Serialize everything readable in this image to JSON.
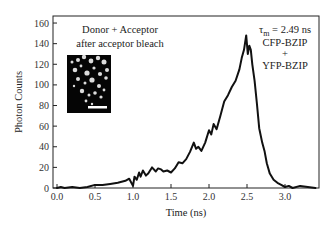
{
  "chart_data": {
    "type": "line",
    "title": "",
    "xlabel": "Time (ns)",
    "ylabel": "Photon Counts",
    "xlim": [
      0.0,
      3.45
    ],
    "ylim": [
      0,
      165
    ],
    "xticks": [
      "0.0",
      "0.5",
      "1.0",
      "1.5",
      "2.0",
      "2.5",
      "3.0"
    ],
    "yticks": [
      "0",
      "20",
      "40",
      "60",
      "80",
      "100",
      "120",
      "140",
      "160"
    ],
    "grid": false,
    "legend": null,
    "annotations": {
      "condition_line1": "Donor + Acceptor",
      "condition_line2": "after acceptor bleach",
      "tau_symbol": "τ",
      "tau_subscript": "m",
      "tau_value": " = 2.49 ns",
      "construct1": "CFP-BZIP",
      "plus": "+",
      "construct2": "YFP-BZIP"
    },
    "inset": "fluorescence micrograph (white puncta on black) with scale bar",
    "series": [
      {
        "name": "Photon Counts",
        "x": [
          0.0,
          0.05,
          0.1,
          0.2,
          0.3,
          0.4,
          0.5,
          0.55,
          0.6,
          0.7,
          0.8,
          0.9,
          0.95,
          1.0,
          1.02,
          1.05,
          1.08,
          1.1,
          1.13,
          1.17,
          1.2,
          1.25,
          1.3,
          1.33,
          1.37,
          1.4,
          1.45,
          1.5,
          1.55,
          1.6,
          1.65,
          1.7,
          1.75,
          1.8,
          1.83,
          1.86,
          1.9,
          1.95,
          2.0,
          2.03,
          2.06,
          2.1,
          2.15,
          2.2,
          2.25,
          2.3,
          2.35,
          2.4,
          2.43,
          2.46,
          2.49,
          2.51,
          2.53,
          2.55,
          2.57,
          2.6,
          2.63,
          2.66,
          2.7,
          2.73,
          2.76,
          2.8,
          2.85,
          2.9,
          2.95,
          3.0,
          3.05,
          3.1,
          3.2,
          3.3,
          3.4
        ],
        "y": [
          0,
          1,
          0,
          1,
          0,
          1,
          3,
          3,
          3,
          4,
          5,
          7,
          9,
          2,
          11,
          8,
          15,
          11,
          17,
          12,
          14,
          20,
          16,
          19,
          18,
          16,
          17,
          15,
          19,
          25,
          24,
          28,
          35,
          44,
          38,
          40,
          36,
          44,
          56,
          52,
          62,
          57,
          70,
          84,
          90,
          98,
          104,
          115,
          126,
          134,
          148,
          130,
          138,
          134,
          120,
          104,
          82,
          58,
          44,
          36,
          24,
          14,
          8,
          5,
          3,
          1,
          2,
          0,
          2,
          1,
          0
        ]
      }
    ]
  }
}
